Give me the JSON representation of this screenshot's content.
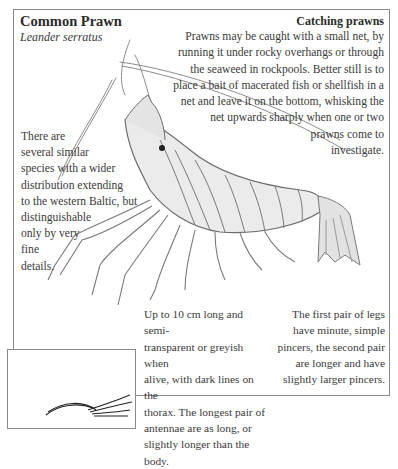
{
  "header": {
    "title": "Common Prawn",
    "latin_name": "Leander serratus"
  },
  "catching": {
    "title": "Catching prawns",
    "lines": [
      "Prawns may be caught with a small net, by",
      "running it under rocky overhangs or through",
      "the seaweed in rockpools. Better still is to",
      "place a bait of macerated fish or shellfish in a",
      "net and leave it on the bottom, whisking the",
      "net upwards sharply when one or two",
      "prawns come to",
      "investigate."
    ]
  },
  "similar_species": {
    "lines": [
      "There are",
      "several similar",
      "species with a wider",
      "distribution extending",
      "to the western Baltic, but",
      "distinguishable",
      "only by very",
      "fine",
      "details."
    ]
  },
  "description": {
    "lines": [
      "Up to 10 cm long and semi-",
      "transparent or greyish when",
      "alive, with dark lines on the",
      "thorax. The longest pair of",
      "antennae are as long, or",
      "slightly longer than the body."
    ]
  },
  "legs": {
    "lines": [
      "The first pair of legs",
      "have minute, simple",
      "pincers, the second pair",
      "are longer and have",
      "slightly larger pincers."
    ]
  },
  "illustrations": {
    "main": "prawn-illustration",
    "inset": "inset-illustration"
  },
  "colors": {
    "frame": "#8a8a8a",
    "text": "#3a3a3a",
    "heading": "#2b2b2b"
  }
}
